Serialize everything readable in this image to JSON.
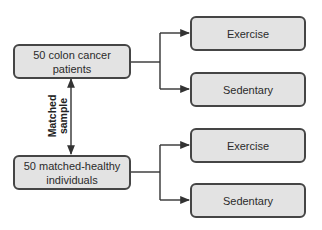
{
  "diagram": {
    "type": "flowchart",
    "colors": {
      "box_fill": "#e3e3e3",
      "box_border": "#454545",
      "line": "#333333",
      "text": "#2b2b2b"
    },
    "groups": [
      {
        "source": {
          "line1": "50 colon cancer",
          "line2": "patients"
        },
        "targets": [
          {
            "label": "Exercise"
          },
          {
            "label": "Sedentary"
          }
        ]
      },
      {
        "source": {
          "line1": "50 matched-healthy",
          "line2": "individuals"
        },
        "targets": [
          {
            "label": "Exercise"
          },
          {
            "label": "Sedentary"
          }
        ]
      }
    ],
    "link": {
      "line1": "Matched",
      "line2": "sample",
      "style": "double-headed-arrow"
    }
  }
}
